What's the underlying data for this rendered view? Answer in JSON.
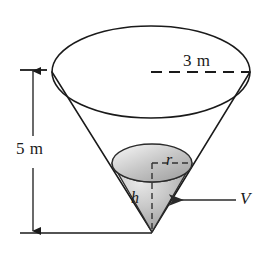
{
  "figure": {
    "background_color": "#ffffff",
    "stroke_color": "#1a1a1a",
    "shading": {
      "fill_light": "#e2e2e2",
      "fill_mid": "#b9b9b9",
      "fill_dark": "#8f8f8f"
    },
    "labels": {
      "top_radius": "3 m",
      "height": "5 m",
      "inner_radius": "r",
      "inner_height": "h",
      "volume": "V"
    },
    "icons": {
      "top_radius_line": "dashed-radius-line-icon",
      "height_dimension": "double-arrow-dimension-icon",
      "volume_pointer": "leader-arrow-icon",
      "inner_radius_line": "dashed-radius-line-icon",
      "inner_height_line": "dashed-height-line-icon"
    },
    "geometry": {
      "outer_ellipse_center_x": 151,
      "outer_ellipse_center_y": 72,
      "outer_ellipse_rx": 99,
      "outer_ellipse_ry": 46,
      "apex_x": 152,
      "apex_y": 232,
      "inner_ellipse_center_x": 152,
      "inner_ellipse_center_y": 163,
      "inner_ellipse_rx": 40,
      "inner_ellipse_ry": 19,
      "dimension_line_x": 33,
      "dimension_top_y": 70,
      "dimension_bottom_y": 232
    }
  }
}
